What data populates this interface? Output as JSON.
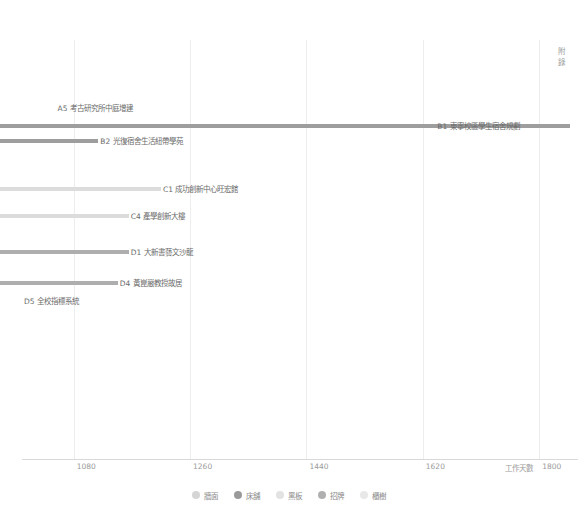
{
  "appendix_marker": {
    "line1": "附",
    "line2": "錄"
  },
  "chart_data": {
    "type": "bar",
    "orientation": "horizontal",
    "title": "",
    "subtitle": "",
    "xlabel": "工作天數",
    "ylabel": "",
    "xlim": [
      1000,
      1860
    ],
    "xticks": [
      1080,
      1260,
      1440,
      1620,
      1800
    ],
    "xtick_labels": [
      "1080",
      "1260",
      "1440",
      "1620",
      "1800"
    ],
    "grid": true,
    "grid_axis": "x",
    "legend_position": "bottom",
    "categories": [
      "A5 考古研究所中庭增建",
      "B1 東寧校區學生宿舍規劃",
      "B2 光復宿舍生活紐帶學苑",
      "C1 成功創新中心旺宏館",
      "C4 產學創新大樓",
      "D1 大新書藝文沙龍",
      "D4 黃崑嚴教授故居",
      "D5 全校指標系統"
    ],
    "values": [
      1052,
      1847,
      1118,
      1215,
      1165,
      1165,
      1148,
      1000
    ],
    "bars": [
      {
        "label": "A5 考古研究所中庭增建",
        "value": 1052,
        "color": "#9e9e9e",
        "label_side": "right",
        "bar_visible": false
      },
      {
        "label": "B1 東寧校區學生宿舍規劃",
        "value": 1847,
        "color": "#9e9e9e",
        "label_side": "left",
        "bar_visible": true
      },
      {
        "label": "B2 光復宿舍生活紐帶學苑",
        "value": 1118,
        "color": "#9e9e9e",
        "label_side": "right",
        "bar_visible": true
      },
      {
        "label": "C1 成功創新中心旺宏館",
        "value": 1215,
        "color": "#dcdcdc",
        "label_side": "right",
        "bar_visible": true
      },
      {
        "label": "C4 產學創新大樓",
        "value": 1165,
        "color": "#dcdcdc",
        "label_side": "right",
        "bar_visible": true
      },
      {
        "label": "D1 大新書藝文沙龍",
        "value": 1165,
        "color": "#aeaeae",
        "label_side": "right",
        "bar_visible": true
      },
      {
        "label": "D4 黃崑嚴教授故居",
        "value": 1148,
        "color": "#aeaeae",
        "label_side": "right",
        "bar_visible": true
      },
      {
        "label": "D5 全校指標系統",
        "value": 1000,
        "color": "#aeaeae",
        "label_side": "right",
        "bar_visible": false
      }
    ],
    "legend": [
      {
        "label": "牆面",
        "color": "#d5d5d5"
      },
      {
        "label": "床舖",
        "color": "#9a9a9a"
      },
      {
        "label": "黑板",
        "color": "#e2e2e2"
      },
      {
        "label": "招牌",
        "color": "#b0b0b0"
      },
      {
        "label": "櫃樹",
        "color": "#e8e8e8"
      }
    ]
  }
}
